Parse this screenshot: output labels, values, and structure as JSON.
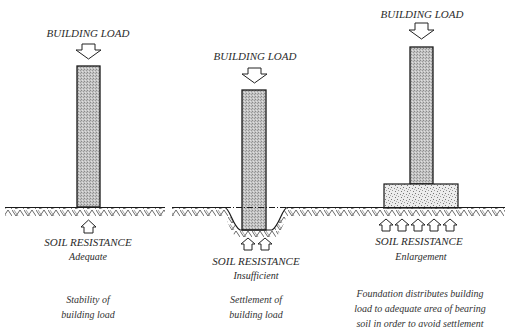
{
  "panels": [
    {
      "id": "stable",
      "load_label": "BUILDING LOAD",
      "resistance_label": "SOIL RESISTANCE",
      "resistance_state": "Adequate",
      "caption": [
        "Stability of",
        "building load"
      ]
    },
    {
      "id": "settlement",
      "load_label": "BUILDING LOAD",
      "resistance_label": "SOIL RESISTANCE",
      "resistance_state": "Insufficient",
      "caption": [
        "Settlement of",
        "building load"
      ]
    },
    {
      "id": "enlargement",
      "load_label": "BUILDING LOAD",
      "resistance_label": "SOIL RESISTANCE",
      "resistance_state": "Enlargement",
      "caption": [
        "Foundation distributes building",
        "load to adequate area of bearing",
        "soil in order to avoid settlement"
      ]
    }
  ],
  "colors": {
    "line": "#1a1a1a",
    "column_fill": "#b9b9b9",
    "footing_fill": "#e4e4e4",
    "text": "#2b2b2b"
  }
}
